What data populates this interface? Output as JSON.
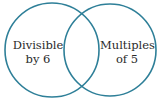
{
  "diagram": {
    "type": "venn",
    "stroke_color": "#2e7f98",
    "sets": [
      {
        "label_line1": "Divisible",
        "label_line2": "by 6",
        "cx": 52,
        "cy": 50,
        "r": 47
      },
      {
        "label_line1": "Multiples",
        "label_line2": "of 5",
        "cx": 110,
        "cy": 50,
        "r": 46
      }
    ]
  }
}
